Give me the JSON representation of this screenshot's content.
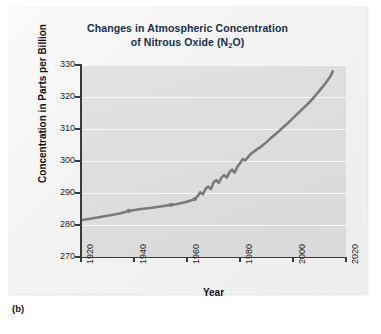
{
  "figure": {
    "caption": "(b)",
    "title_line1": "Changes in Atmospheric Concentration",
    "title_line2_pre": "of Nitrous Oxide (N",
    "title_line2_sub": "2",
    "title_line2_post": "O)"
  },
  "colors": {
    "line": "#7a7a7a",
    "plot_background": "#dedede",
    "gridline": "#f6f6f6",
    "axis": "#3a3a3a",
    "title_text": "#15304a",
    "page_background": "#ffffff"
  },
  "chart_data": {
    "type": "line",
    "title": "Changes in Atmospheric Concentration of Nitrous Oxide (N2O)",
    "xlabel": "Year",
    "ylabel": "Concentration in Parts per Billion",
    "xlim": [
      1920,
      2020
    ],
    "ylim": [
      270,
      330
    ],
    "xticks": [
      1920,
      1940,
      1960,
      1980,
      2000,
      2020
    ],
    "yticks": [
      270,
      280,
      290,
      300,
      310,
      320,
      330
    ],
    "xtick_labels": [
      "1920",
      "1940",
      "1960",
      "1980",
      "2000",
      "2020"
    ],
    "ytick_labels": [
      "270",
      "280",
      "290",
      "300",
      "310",
      "320",
      "330"
    ],
    "grid": "horizontal",
    "legend": "none",
    "series": [
      {
        "name": "Atmospheric N2O concentration",
        "units": "parts per billion",
        "x": [
          1920,
          1925,
          1930,
          1935,
          1938,
          1942,
          1946,
          1950,
          1954,
          1956,
          1958,
          1960,
          1962,
          1963,
          1964,
          1965,
          1966,
          1967,
          1968,
          1969,
          1970,
          1971,
          1972,
          1973,
          1974,
          1975,
          1976,
          1977,
          1978,
          1979,
          1980,
          1981,
          1982,
          1984,
          1986,
          1988,
          1990,
          1992,
          1994,
          1996,
          1998,
          2000,
          2002,
          2004,
          2006,
          2008,
          2010,
          2012,
          2014,
          2015
        ],
        "y": [
          281.5,
          282.2,
          282.9,
          283.7,
          284.4,
          284.9,
          285.3,
          285.8,
          286.3,
          286.5,
          286.9,
          287.3,
          287.8,
          288.1,
          289.0,
          290.2,
          289.6,
          291.3,
          292.0,
          291.2,
          293.3,
          294.0,
          293.2,
          294.8,
          295.6,
          294.8,
          296.5,
          297.3,
          296.4,
          298.2,
          299.3,
          300.6,
          300.2,
          302.2,
          303.4,
          304.5,
          305.9,
          307.4,
          308.8,
          310.3,
          311.8,
          313.4,
          315.0,
          316.6,
          318.2,
          320.0,
          322.0,
          324.0,
          326.3,
          328.0
        ]
      }
    ],
    "markers_visible_years": [
      1938,
      1955,
      1963
    ],
    "annotations": []
  }
}
